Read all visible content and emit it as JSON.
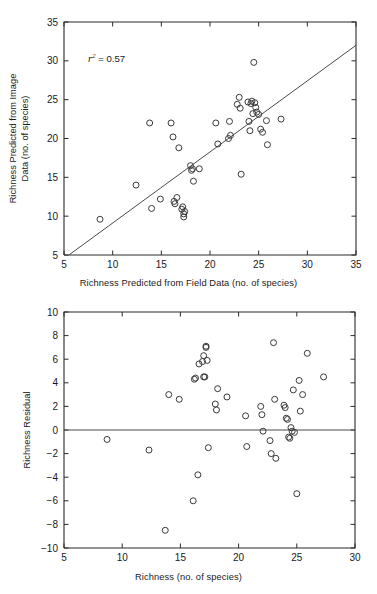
{
  "figure": {
    "background": "#ffffff",
    "axis_color": "#2b2b2b",
    "marker_color": "#3a3a3a",
    "line_color": "#4a4a4a"
  },
  "chart_data": [
    {
      "type": "scatter",
      "panel": "top",
      "title": "",
      "xlabel": "Richness Predicted  from Field Data (no. of species)",
      "ylabel": "Richness Predicted  from Image Data (no. of species)",
      "ylabel_lines": [
        "Richness Predicted  from Image",
        "Data (no. of species)"
      ],
      "xlim": [
        5,
        35
      ],
      "ylim": [
        5,
        35
      ],
      "xticks": [
        5,
        10,
        15,
        20,
        25,
        30,
        35
      ],
      "yticks": [
        5,
        10,
        15,
        20,
        25,
        30,
        35
      ],
      "grid": false,
      "legend": null,
      "annotations": [
        {
          "text": "r2 = 0.57",
          "display": "r² = 0.57",
          "r_squared": 0.57,
          "x": 11.2,
          "y": 30.3
        }
      ],
      "reference_line": {
        "kind": "identity",
        "label": "1:1 line",
        "x": [
          5.5,
          35.0
        ],
        "y": [
          5.0,
          32.0
        ]
      },
      "points": [
        {
          "x": 8.7,
          "y": 9.6
        },
        {
          "x": 12.4,
          "y": 14.0
        },
        {
          "x": 13.8,
          "y": 22.0
        },
        {
          "x": 14.0,
          "y": 11.0
        },
        {
          "x": 14.9,
          "y": 12.2
        },
        {
          "x": 16.0,
          "y": 22.0
        },
        {
          "x": 16.2,
          "y": 20.2
        },
        {
          "x": 16.3,
          "y": 11.9
        },
        {
          "x": 16.4,
          "y": 11.6
        },
        {
          "x": 16.6,
          "y": 12.4
        },
        {
          "x": 16.8,
          "y": 18.8
        },
        {
          "x": 17.1,
          "y": 10.9
        },
        {
          "x": 17.2,
          "y": 11.2
        },
        {
          "x": 17.3,
          "y": 10.3
        },
        {
          "x": 17.3,
          "y": 9.9
        },
        {
          "x": 17.4,
          "y": 10.6
        },
        {
          "x": 18.0,
          "y": 16.5
        },
        {
          "x": 18.1,
          "y": 15.9
        },
        {
          "x": 18.2,
          "y": 16.1
        },
        {
          "x": 18.3,
          "y": 14.5
        },
        {
          "x": 18.9,
          "y": 16.1
        },
        {
          "x": 20.6,
          "y": 22.0
        },
        {
          "x": 20.8,
          "y": 19.3
        },
        {
          "x": 21.9,
          "y": 20.0
        },
        {
          "x": 22.0,
          "y": 22.2
        },
        {
          "x": 22.1,
          "y": 20.4
        },
        {
          "x": 22.8,
          "y": 24.4
        },
        {
          "x": 23.0,
          "y": 25.3
        },
        {
          "x": 23.1,
          "y": 23.9
        },
        {
          "x": 23.2,
          "y": 15.4
        },
        {
          "x": 23.9,
          "y": 24.7
        },
        {
          "x": 24.0,
          "y": 22.2
        },
        {
          "x": 24.1,
          "y": 21.0
        },
        {
          "x": 24.2,
          "y": 24.5
        },
        {
          "x": 24.3,
          "y": 24.8
        },
        {
          "x": 24.4,
          "y": 23.2
        },
        {
          "x": 24.5,
          "y": 29.8
        },
        {
          "x": 24.6,
          "y": 24.6
        },
        {
          "x": 24.7,
          "y": 24.0
        },
        {
          "x": 24.8,
          "y": 23.4
        },
        {
          "x": 25.0,
          "y": 23.1
        },
        {
          "x": 25.2,
          "y": 21.2
        },
        {
          "x": 25.4,
          "y": 20.8
        },
        {
          "x": 25.8,
          "y": 22.3
        },
        {
          "x": 25.9,
          "y": 19.2
        },
        {
          "x": 27.3,
          "y": 22.5
        }
      ]
    },
    {
      "type": "scatter",
      "panel": "bottom",
      "title": "",
      "xlabel": "Richness (no. of species)",
      "ylabel": "Richness Residual",
      "ylabel_lines": [
        "Richness Residual"
      ],
      "xlim": [
        5,
        30
      ],
      "ylim": [
        -10,
        10
      ],
      "xticks": [
        5,
        10,
        15,
        20,
        25,
        30
      ],
      "yticks": [
        -10,
        -8,
        -6,
        -4,
        -2,
        0,
        2,
        4,
        6,
        8,
        10
      ],
      "ytick_labels": [
        "−10",
        "−8",
        "−6",
        "−4",
        "−2",
        "0",
        "2",
        "4",
        "6",
        "8",
        "10"
      ],
      "grid": false,
      "legend": null,
      "annotations": [],
      "reference_line": {
        "kind": "zero",
        "label": "y = 0",
        "x": [
          5,
          30
        ],
        "y": [
          0,
          0
        ]
      },
      "points": [
        {
          "x": 8.7,
          "y": -0.8
        },
        {
          "x": 12.3,
          "y": -1.7
        },
        {
          "x": 13.7,
          "y": -8.5
        },
        {
          "x": 14.0,
          "y": 3.0
        },
        {
          "x": 14.9,
          "y": 2.6
        },
        {
          "x": 16.1,
          "y": -6.0
        },
        {
          "x": 16.2,
          "y": 4.3
        },
        {
          "x": 16.3,
          "y": 4.4
        },
        {
          "x": 16.5,
          "y": -3.8
        },
        {
          "x": 16.6,
          "y": 5.6
        },
        {
          "x": 16.9,
          "y": 5.8
        },
        {
          "x": 17.0,
          "y": 6.3
        },
        {
          "x": 17.0,
          "y": 4.5
        },
        {
          "x": 17.1,
          "y": 4.5
        },
        {
          "x": 17.2,
          "y": 7.0
        },
        {
          "x": 17.2,
          "y": 7.1
        },
        {
          "x": 17.3,
          "y": 5.9
        },
        {
          "x": 17.4,
          "y": -1.5
        },
        {
          "x": 18.0,
          "y": 2.2
        },
        {
          "x": 18.1,
          "y": 1.7
        },
        {
          "x": 18.2,
          "y": 3.5
        },
        {
          "x": 19.0,
          "y": 2.8
        },
        {
          "x": 20.6,
          "y": 1.2
        },
        {
          "x": 20.7,
          "y": -1.4
        },
        {
          "x": 21.9,
          "y": 2.0
        },
        {
          "x": 22.0,
          "y": 1.3
        },
        {
          "x": 22.1,
          "y": -0.1
        },
        {
          "x": 22.7,
          "y": -0.9
        },
        {
          "x": 22.8,
          "y": -2.0
        },
        {
          "x": 23.0,
          "y": 7.4
        },
        {
          "x": 23.1,
          "y": 2.6
        },
        {
          "x": 23.2,
          "y": -2.4
        },
        {
          "x": 23.9,
          "y": 2.1
        },
        {
          "x": 24.0,
          "y": 1.9
        },
        {
          "x": 24.1,
          "y": 1.0
        },
        {
          "x": 24.2,
          "y": 0.9
        },
        {
          "x": 24.3,
          "y": -0.6
        },
        {
          "x": 24.4,
          "y": -0.7
        },
        {
          "x": 24.5,
          "y": 0.2
        },
        {
          "x": 24.6,
          "y": -0.1
        },
        {
          "x": 24.7,
          "y": 3.4
        },
        {
          "x": 24.8,
          "y": -0.2
        },
        {
          "x": 25.0,
          "y": -5.4
        },
        {
          "x": 25.2,
          "y": 4.2
        },
        {
          "x": 25.3,
          "y": 1.6
        },
        {
          "x": 25.5,
          "y": 3.0
        },
        {
          "x": 25.9,
          "y": 6.5
        },
        {
          "x": 27.3,
          "y": 4.5
        }
      ]
    }
  ]
}
